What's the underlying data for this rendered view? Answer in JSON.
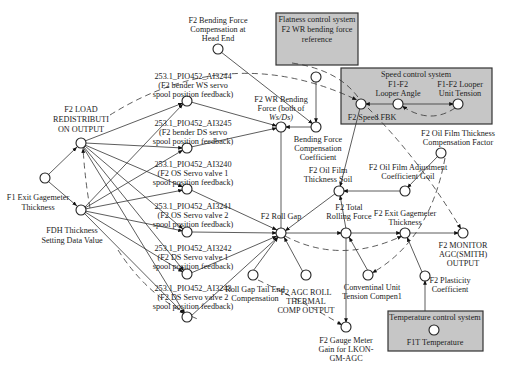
{
  "systems": {
    "flatness": {
      "line1": "Flatness control system",
      "line2": "F2 WR bending force",
      "line3": "reference"
    },
    "speed": {
      "title": "Speed control system"
    },
    "temperature": {
      "title": "Temperature control system",
      "node": "F1T Temperature"
    }
  },
  "nodes": {
    "load_redist": [
      "F2 LOAD",
      "REDISTRIBUTI",
      "ON OUTPUT"
    ],
    "f1_exit": [
      "F1 Exit Gagemeter",
      "Thickness"
    ],
    "fdh": [
      "FDH Thickness",
      "Setting Data Value"
    ],
    "ai3244": [
      "253.1_PIO452_AI3244",
      "(F2 bender WS servo",
      "spool position feedback)"
    ],
    "ai3245": [
      "253.1_PIO452_AI3245",
      "(F2 bender DS servo",
      "spool position feedback)"
    ],
    "ai3240": [
      "253.1_PIO452_AI3240",
      "(F2 OS Servo valve 1",
      "spool position feedback)"
    ],
    "ai3241": [
      "253.1_PIO452_AI3241",
      "(F2 OS Servo valve 2",
      "spool position feedback)"
    ],
    "ai3242": [
      "253.1_PIO452_AI3242",
      "(F2 DS Servo valve 1",
      "spool position feedback)"
    ],
    "ai3243": [
      "253.1_PIO452_AI3243",
      "(F2 DS Servo valve 2",
      "spool position feedback)"
    ],
    "bend_head": [
      "F2 Bending Force",
      "Compensation at",
      "Head End"
    ],
    "wr_bend": [
      "F2 WR Bending",
      "Force (both of",
      "Ws/Ds)"
    ],
    "bend_coef": [
      "Bending Force",
      "Compensation",
      "Coefficient"
    ],
    "roll_gap": [
      "F2 Roll Gap"
    ],
    "oil_soil": [
      "F2 Oil Film",
      "Thickness Soil"
    ],
    "oil_goil": [
      "F2 Oil Film Adjustment",
      "Coefficient Goil"
    ],
    "oil_factor": [
      "F2 Oil Film Thickness",
      "Compensation Factor"
    ],
    "speed_fbk": [
      "F2 Speed FBK"
    ],
    "looper_angle": [
      "F1-F2",
      "Looper Angle"
    ],
    "looper_tension": [
      "F1-F2 Looper",
      "Unit Tension"
    ],
    "total_force": [
      "F2 Total",
      "Rolling Force"
    ],
    "f2_exit": [
      "F2 Exit Gagemeter",
      "Thickness"
    ],
    "monitor": [
      "F2 MONITOR",
      "AGC(SMITH)",
      "OUTPUT"
    ],
    "tail_end": [
      "Roll Gap Tail End",
      "Compensation"
    ],
    "thermal": [
      "F2 AGC ROLL",
      "THERMAL",
      "COMP OUTPUT"
    ],
    "conv_tension": [
      "Conventinal Unit",
      "Tension Compen1"
    ],
    "plasticity": [
      "F2 Plasticity",
      "Coefficient"
    ],
    "gauge_meter": [
      "F2 Gauge Meter",
      "Gain for LKON-",
      "GM-AGC"
    ]
  }
}
